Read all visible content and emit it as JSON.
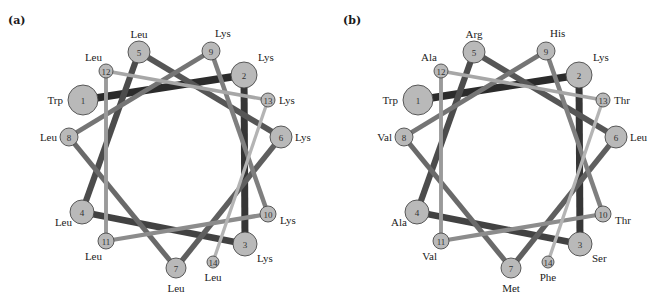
{
  "figure": {
    "panels": [
      {
        "id": "a",
        "label": "(a)",
        "residues": [
          {
            "n": "1",
            "aa": "Trp"
          },
          {
            "n": "2",
            "aa": "Lys"
          },
          {
            "n": "3",
            "aa": "Lys"
          },
          {
            "n": "4",
            "aa": "Leu"
          },
          {
            "n": "5",
            "aa": "Leu"
          },
          {
            "n": "6",
            "aa": "Lys"
          },
          {
            "n": "7",
            "aa": "Leu"
          },
          {
            "n": "8",
            "aa": "Leu"
          },
          {
            "n": "9",
            "aa": "Lys"
          },
          {
            "n": "10",
            "aa": "Lys"
          },
          {
            "n": "11",
            "aa": "Leu"
          },
          {
            "n": "12",
            "aa": "Leu"
          },
          {
            "n": "13",
            "aa": "Lys"
          },
          {
            "n": "14",
            "aa": "Leu"
          }
        ]
      },
      {
        "id": "b",
        "label": "(b)",
        "residues": [
          {
            "n": "1",
            "aa": "Trp"
          },
          {
            "n": "2",
            "aa": "Lys"
          },
          {
            "n": "3",
            "aa": "Ser"
          },
          {
            "n": "4",
            "aa": "Ala"
          },
          {
            "n": "5",
            "aa": "Arg"
          },
          {
            "n": "6",
            "aa": "Leu"
          },
          {
            "n": "7",
            "aa": "Met"
          },
          {
            "n": "8",
            "aa": "Val"
          },
          {
            "n": "9",
            "aa": "His"
          },
          {
            "n": "10",
            "aa": "Thr"
          },
          {
            "n": "11",
            "aa": "Val"
          },
          {
            "n": "12",
            "aa": "Ala"
          },
          {
            "n": "13",
            "aa": "Thr"
          },
          {
            "n": "14",
            "aa": "Phe"
          }
        ]
      }
    ],
    "colors": {
      "node_fill": "#b9b9b9",
      "node_stroke": "#4a4a4a",
      "link_gradient": [
        "#2b2b2b",
        "#363636",
        "#424242",
        "#4c4c4c",
        "#565656",
        "#5f5f5f",
        "#6a6a6a",
        "#757575",
        "#7f7f7f",
        "#8c8c8c",
        "#9a9a9a",
        "#a7a7a7",
        "#b4b4b4"
      ]
    }
  }
}
